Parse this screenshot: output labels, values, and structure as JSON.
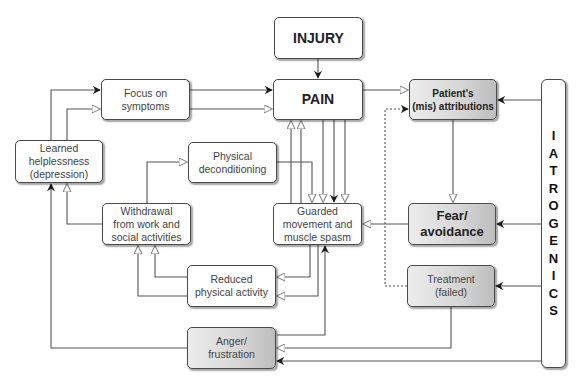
{
  "diagram": {
    "type": "flowchart",
    "title": "",
    "nodes": {
      "injury": {
        "label": "INJURY"
      },
      "pain": {
        "label": "PAIN"
      },
      "focus": {
        "label": "Focus on\nsymptoms"
      },
      "helpless": {
        "label": "Learned\nhelplessness\n(depression)"
      },
      "decond": {
        "label": "Physical\ndeconditioning"
      },
      "attrib": {
        "label": "Patient's\n(mis) attributions"
      },
      "withdrawal": {
        "label": "Withdrawal\nfrom work and\nsocial activities"
      },
      "guarded": {
        "label": "Guarded\nmovement and\nmuscle spasm"
      },
      "fear": {
        "label": "Fear/\navoidance"
      },
      "reduced": {
        "label": "Reduced\nphysical activity"
      },
      "treatment": {
        "label": "Treatment\n(failed)"
      },
      "anger": {
        "label": "Anger/\nfrustration"
      },
      "iatrogenics": {
        "label": "IATROGENICS",
        "letters": [
          "I",
          "A",
          "T",
          "R",
          "O",
          "G",
          "E",
          "N",
          "I",
          "C",
          "S"
        ]
      }
    },
    "edges": [
      {
        "from": "INJURY",
        "to": "PAIN"
      },
      {
        "from": "Focus on symptoms",
        "to": "PAIN",
        "count": 2
      },
      {
        "from": "Learned helplessness",
        "to": "Focus on symptoms",
        "count": 2
      },
      {
        "from": "PAIN",
        "to": "Patient's (mis) attributions"
      },
      {
        "from": "PAIN",
        "to": "Guarded movement and muscle spasm",
        "count": 3
      },
      {
        "from": "Guarded movement and muscle spasm",
        "to": "PAIN",
        "count": 2
      },
      {
        "from": "Physical deconditioning",
        "to": "Guarded movement and muscle spasm"
      },
      {
        "from": "Withdrawal from work and social activities",
        "to": "Physical deconditioning"
      },
      {
        "from": "Withdrawal from work and social activities",
        "to": "Learned helplessness"
      },
      {
        "from": "Reduced physical activity",
        "to": "Withdrawal from work and social activities",
        "count": 2
      },
      {
        "from": "Guarded movement and muscle spasm",
        "to": "Reduced physical activity",
        "count": 2
      },
      {
        "from": "Anger/frustration",
        "to": "Learned helplessness"
      },
      {
        "from": "Anger/frustration",
        "to": "Guarded movement and muscle spasm"
      },
      {
        "from": "Patient's (mis) attributions",
        "to": "Fear/avoidance"
      },
      {
        "from": "Fear/avoidance",
        "to": "Guarded movement and muscle spasm"
      },
      {
        "from": "Treatment (failed)",
        "to": "Patient's (mis) attributions",
        "style": "dotted"
      },
      {
        "from": "Treatment (failed)",
        "to": "Anger/frustration"
      },
      {
        "from": "IATROGENICS",
        "to": "Patient's (mis) attributions"
      },
      {
        "from": "IATROGENICS",
        "to": "Fear/avoidance"
      },
      {
        "from": "IATROGENICS",
        "to": "Treatment (failed)"
      },
      {
        "from": "IATROGENICS",
        "to": "Anger/frustration"
      }
    ]
  }
}
